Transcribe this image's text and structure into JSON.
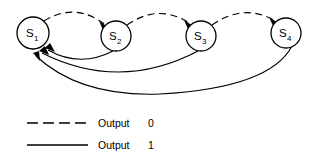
{
  "diagram": {
    "type": "state-transition-diagram",
    "states": [
      {
        "id": "s1",
        "label": "S",
        "subscript": "1",
        "cx": 33,
        "cy": 33,
        "r": 16
      },
      {
        "id": "s2",
        "label": "S",
        "subscript": "2",
        "cx": 116,
        "cy": 36,
        "r": 15
      },
      {
        "id": "s3",
        "label": "S",
        "subscript": "3",
        "cx": 201,
        "cy": 36,
        "r": 15
      },
      {
        "id": "s4",
        "label": "S",
        "subscript": "4",
        "cx": 286,
        "cy": 33,
        "r": 15
      }
    ],
    "transitions": [
      {
        "id": "t-s1-s2",
        "from": "s1",
        "to": "s2",
        "output": "0",
        "style": "dashed",
        "position": "above"
      },
      {
        "id": "t-s2-s3",
        "from": "s2",
        "to": "s3",
        "output": "0",
        "style": "dashed",
        "position": "above"
      },
      {
        "id": "t-s3-s4",
        "from": "s3",
        "to": "s4",
        "output": "0",
        "style": "dashed",
        "position": "above"
      },
      {
        "id": "t-s2-s1",
        "from": "s2",
        "to": "s1",
        "output": "1",
        "style": "solid",
        "position": "below"
      },
      {
        "id": "t-s3-s1",
        "from": "s3",
        "to": "s1",
        "output": "1",
        "style": "solid",
        "position": "below"
      },
      {
        "id": "t-s4-s1",
        "from": "s4",
        "to": "s1",
        "output": "1",
        "style": "solid",
        "position": "below"
      }
    ]
  },
  "legend": {
    "entries": [
      {
        "id": "legend-output-0",
        "style": "dashed",
        "label": "Output",
        "value": "0"
      },
      {
        "id": "legend-output-1",
        "style": "solid",
        "label": "Output",
        "value": "1"
      }
    ]
  },
  "colors": {
    "stroke": "#000000",
    "background": "#ffffff"
  }
}
